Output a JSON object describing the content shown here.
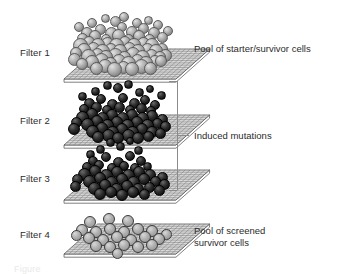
{
  "figure": {
    "type": "scientific-diagram",
    "background_color": "#ffffff",
    "text_color": "#2b2b2b"
  },
  "filters": [
    {
      "id": "filter-1",
      "label": "Filter 1",
      "label_x": 20,
      "label_y": 47,
      "plate_x": 62,
      "plate_y": 47,
      "plate_w": 112,
      "plate_h": 30,
      "cell_style": "light",
      "description": "Pool of starter/survivor cells",
      "cells": [
        [
          18,
          30,
          7.5
        ],
        [
          27,
          27,
          6.0
        ],
        [
          36,
          30,
          7.0
        ],
        [
          45,
          28,
          6.5
        ],
        [
          54,
          30,
          7.5
        ],
        [
          63,
          27,
          6.0
        ],
        [
          72,
          30,
          7.0
        ],
        [
          81,
          28,
          6.5
        ],
        [
          90,
          30,
          7.0
        ],
        [
          22,
          35,
          7.0
        ],
        [
          31,
          33,
          6.5
        ],
        [
          40,
          36,
          7.5
        ],
        [
          49,
          34,
          6.0
        ],
        [
          58,
          36,
          7.0
        ],
        [
          67,
          33,
          6.5
        ],
        [
          76,
          36,
          7.0
        ],
        [
          85,
          34,
          6.5
        ],
        [
          94,
          36,
          7.0
        ],
        [
          26,
          41,
          7.5
        ],
        [
          35,
          39,
          6.5
        ],
        [
          44,
          42,
          7.0
        ],
        [
          53,
          40,
          7.5
        ],
        [
          62,
          42,
          6.5
        ],
        [
          71,
          39,
          7.0
        ],
        [
          80,
          42,
          7.5
        ],
        [
          89,
          40,
          6.5
        ],
        [
          98,
          42,
          6.0
        ],
        [
          30,
          47,
          7.0
        ],
        [
          39,
          45,
          7.5
        ],
        [
          48,
          48,
          6.5
        ],
        [
          57,
          46,
          7.0
        ],
        [
          66,
          48,
          7.5
        ],
        [
          75,
          45,
          6.5
        ],
        [
          84,
          48,
          7.0
        ],
        [
          93,
          46,
          6.0
        ],
        [
          34,
          53,
          6.5
        ],
        [
          43,
          51,
          7.0
        ],
        [
          52,
          54,
          7.5
        ],
        [
          61,
          52,
          6.5
        ],
        [
          70,
          54,
          7.0
        ],
        [
          79,
          51,
          7.5
        ],
        [
          88,
          53,
          6.5
        ],
        [
          14,
          38,
          6.0
        ],
        [
          12,
          44,
          6.5
        ],
        [
          20,
          49,
          6.0
        ],
        [
          100,
          34,
          6.0
        ],
        [
          103,
          40,
          6.5
        ],
        [
          99,
          46,
          6.0
        ],
        [
          25,
          18,
          6.0
        ],
        [
          38,
          14,
          5.5
        ],
        [
          49,
          18,
          6.5
        ],
        [
          60,
          12,
          5.0
        ],
        [
          70,
          17,
          6.0
        ],
        [
          81,
          13,
          5.5
        ],
        [
          92,
          18,
          6.0
        ],
        [
          100,
          22,
          5.5
        ],
        [
          20,
          23,
          5.5
        ],
        [
          33,
          21,
          6.0
        ],
        [
          44,
          24,
          5.0
        ],
        [
          56,
          20,
          6.5
        ],
        [
          66,
          24,
          5.5
        ],
        [
          77,
          21,
          6.0
        ],
        [
          87,
          24,
          5.5
        ],
        [
          30,
          8,
          5.0
        ],
        [
          53,
          6,
          5.5
        ],
        [
          75,
          8,
          5.0
        ],
        [
          43,
          3,
          4.5
        ],
        [
          62,
          2,
          5.0
        ],
        [
          86,
          5,
          4.5
        ],
        [
          17,
          12,
          5.0
        ],
        [
          96,
          10,
          5.0
        ],
        [
          106,
          16,
          5.0
        ]
      ]
    },
    {
      "id": "filter-2",
      "label": "Filter 2",
      "label_x": 20,
      "label_y": 115,
      "plate_x": 62,
      "plate_y": 113,
      "plate_w": 112,
      "plate_h": 30,
      "cell_style": "dark",
      "description": "Induced mutations",
      "cells": [
        [
          20,
          36,
          6.5
        ],
        [
          30,
          33,
          6.0
        ],
        [
          40,
          37,
          6.5
        ],
        [
          50,
          34,
          6.0
        ],
        [
          60,
          37,
          6.5
        ],
        [
          70,
          34,
          6.0
        ],
        [
          80,
          37,
          6.5
        ],
        [
          90,
          35,
          6.0
        ],
        [
          25,
          43,
          6.5
        ],
        [
          35,
          40,
          6.0
        ],
        [
          45,
          44,
          6.5
        ],
        [
          55,
          41,
          6.0
        ],
        [
          65,
          44,
          6.5
        ],
        [
          75,
          41,
          6.0
        ],
        [
          85,
          44,
          6.5
        ],
        [
          95,
          42,
          5.5
        ],
        [
          30,
          50,
          6.5
        ],
        [
          40,
          47,
          6.0
        ],
        [
          50,
          51,
          6.5
        ],
        [
          60,
          48,
          6.0
        ],
        [
          70,
          51,
          6.5
        ],
        [
          80,
          48,
          6.0
        ],
        [
          90,
          51,
          6.0
        ],
        [
          36,
          56,
          6.0
        ],
        [
          46,
          54,
          6.5
        ],
        [
          56,
          57,
          6.0
        ],
        [
          66,
          54,
          6.5
        ],
        [
          76,
          57,
          6.0
        ],
        [
          86,
          55,
          5.5
        ],
        [
          14,
          41,
          5.5
        ],
        [
          12,
          48,
          6.0
        ],
        [
          100,
          38,
          5.5
        ],
        [
          103,
          45,
          5.5
        ],
        [
          98,
          52,
          5.5
        ],
        [
          27,
          22,
          5.5
        ],
        [
          39,
          18,
          5.0
        ],
        [
          50,
          23,
          5.5
        ],
        [
          61,
          17,
          5.0
        ],
        [
          72,
          22,
          5.5
        ],
        [
          83,
          19,
          5.0
        ],
        [
          93,
          24,
          5.0
        ],
        [
          22,
          28,
          5.0
        ],
        [
          34,
          26,
          5.5
        ],
        [
          45,
          29,
          5.0
        ],
        [
          57,
          26,
          5.5
        ],
        [
          68,
          29,
          5.0
        ],
        [
          79,
          27,
          5.5
        ],
        [
          89,
          30,
          5.0
        ],
        [
          33,
          10,
          4.5
        ],
        [
          56,
          7,
          5.0
        ],
        [
          77,
          11,
          4.5
        ],
        [
          45,
          4,
          4.5
        ],
        [
          66,
          3,
          4.5
        ],
        [
          88,
          8,
          4.0
        ],
        [
          20,
          15,
          4.5
        ],
        [
          99,
          14,
          4.5
        ]
      ]
    },
    {
      "id": "filter-3",
      "label": "Filter 3",
      "label_x": 20,
      "label_y": 173,
      "plate_x": 62,
      "plate_y": 168,
      "plate_w": 112,
      "plate_h": 30,
      "cell_style": "dark",
      "description": "Induced mutations",
      "cells": [
        [
          22,
          38,
          6.5
        ],
        [
          33,
          35,
          6.0
        ],
        [
          44,
          39,
          6.5
        ],
        [
          55,
          36,
          6.0
        ],
        [
          66,
          39,
          6.5
        ],
        [
          77,
          36,
          6.0
        ],
        [
          88,
          39,
          6.0
        ],
        [
          27,
          45,
          6.5
        ],
        [
          38,
          42,
          6.0
        ],
        [
          49,
          46,
          6.5
        ],
        [
          60,
          43,
          6.0
        ],
        [
          71,
          46,
          6.5
        ],
        [
          82,
          43,
          6.0
        ],
        [
          93,
          45,
          5.5
        ],
        [
          32,
          52,
          6.5
        ],
        [
          43,
          49,
          6.0
        ],
        [
          54,
          53,
          6.5
        ],
        [
          65,
          50,
          6.0
        ],
        [
          76,
          53,
          6.0
        ],
        [
          87,
          51,
          5.5
        ],
        [
          38,
          58,
          6.0
        ],
        [
          49,
          56,
          6.0
        ],
        [
          60,
          59,
          6.0
        ],
        [
          71,
          56,
          6.0
        ],
        [
          82,
          58,
          5.5
        ],
        [
          15,
          43,
          5.5
        ],
        [
          13,
          50,
          5.5
        ],
        [
          100,
          41,
          5.5
        ],
        [
          102,
          48,
          5.5
        ],
        [
          97,
          54,
          5.5
        ],
        [
          31,
          25,
          5.0
        ],
        [
          44,
          21,
          5.0
        ],
        [
          56,
          26,
          5.5
        ],
        [
          68,
          20,
          5.0
        ],
        [
          79,
          25,
          5.0
        ],
        [
          25,
          31,
          5.0
        ],
        [
          37,
          29,
          5.0
        ],
        [
          50,
          32,
          5.0
        ],
        [
          62,
          30,
          5.0
        ],
        [
          73,
          32,
          5.0
        ],
        [
          85,
          30,
          4.5
        ],
        [
          38,
          13,
          4.5
        ],
        [
          58,
          10,
          4.5
        ],
        [
          76,
          14,
          4.5
        ],
        [
          48,
          6,
          4.5
        ],
        [
          68,
          5,
          4.0
        ],
        [
          28,
          18,
          4.5
        ]
      ]
    },
    {
      "id": "filter-4",
      "label": "Filter 4",
      "label_x": 20,
      "label_y": 229,
      "plate_x": 62,
      "plate_y": 222,
      "plate_w": 112,
      "plate_h": 30,
      "cell_style": "ring",
      "description": "Pool of screened\nsurvivor cells",
      "cells": [
        [
          28,
          32,
          6.0
        ],
        [
          47,
          29,
          6.0
        ],
        [
          66,
          31,
          6.0
        ],
        [
          20,
          40,
          6.0
        ],
        [
          34,
          42,
          6.0
        ],
        [
          48,
          39,
          6.0
        ],
        [
          62,
          42,
          6.0
        ],
        [
          76,
          39,
          6.0
        ],
        [
          90,
          41,
          6.0
        ],
        [
          27,
          48,
          6.0
        ],
        [
          41,
          50,
          6.0
        ],
        [
          55,
          47,
          6.0
        ],
        [
          69,
          50,
          6.0
        ],
        [
          83,
          47,
          6.0
        ],
        [
          97,
          49,
          6.0
        ],
        [
          34,
          56,
          6.0
        ],
        [
          48,
          57,
          6.0
        ],
        [
          62,
          55,
          6.0
        ],
        [
          76,
          57,
          6.0
        ],
        [
          90,
          55,
          6.0
        ],
        [
          14,
          45,
          5.5
        ],
        [
          104,
          44,
          5.5
        ],
        [
          55,
          63,
          5.5
        ]
      ]
    }
  ],
  "side_labels": [
    {
      "id": "label-starter-pool",
      "text": "Pool of starter/survivor cells",
      "x": 194,
      "y": 43
    },
    {
      "id": "label-induced-mutations",
      "text": "Induced mutations",
      "x": 194,
      "y": 130
    },
    {
      "id": "label-screened-pool",
      "text": "Pool of screened\nsurvivor cells",
      "x": 194,
      "y": 225
    }
  ],
  "bracket": {
    "id": "induced-mutations-bracket",
    "x": 177,
    "y_top": 81,
    "y_bottom": 190,
    "tick_length": 8,
    "mid_tick_y": 135,
    "mid_tick_length": 12,
    "color": "#8a8a8a"
  },
  "plate": {
    "mesh_color": "#6f6f6f",
    "face_color": "#d9d9d9",
    "edge_color": "#4a4a4a",
    "side_color": "#ffffff",
    "mesh_lines": 13
  },
  "caption": {
    "text": "Figure",
    "x": 14,
    "y": 264
  }
}
